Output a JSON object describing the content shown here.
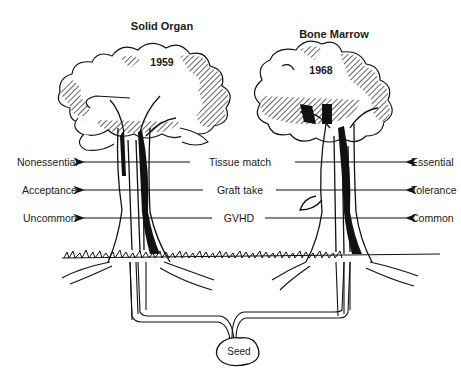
{
  "diagram": {
    "trees": [
      {
        "title": "Solid Organ",
        "year": "1959"
      },
      {
        "title": "Bone Marrow",
        "year": "1968"
      }
    ],
    "rows": [
      {
        "left": "Nonessential",
        "center": "Tissue match",
        "right": "Essential"
      },
      {
        "left": "Acceptance",
        "center": "Graft take",
        "right": "Tolerance"
      },
      {
        "left": "Uncommon",
        "center": "GVHD",
        "right": "Common"
      }
    ],
    "root": {
      "label": "Seed"
    },
    "colors": {
      "ink": "#111111",
      "background": "#ffffff"
    }
  }
}
